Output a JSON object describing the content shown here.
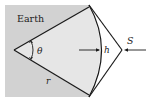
{
  "diagram": {
    "region_label": "Earth",
    "angle_label": "θ",
    "height_label": "h",
    "satellite_label": "S",
    "radius_label": "r"
  },
  "colors": {
    "earth_fill": "#d2d2d2",
    "sector_fill": "#e6e6e6",
    "line": "#1a1a1a",
    "background": "#ffffff"
  }
}
